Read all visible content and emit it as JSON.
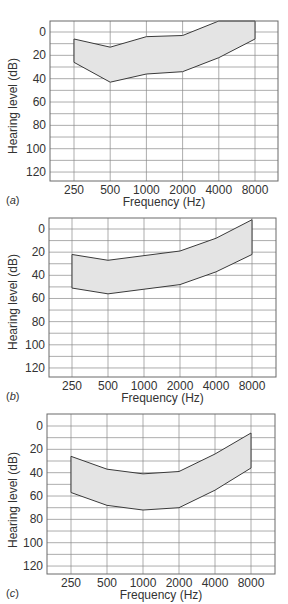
{
  "figure": {
    "panels": [
      {
        "letter_open": "(",
        "letter": "a",
        "letter_close": ")"
      },
      {
        "letter_open": "(",
        "letter": "b",
        "letter_close": ")"
      },
      {
        "letter_open": "(",
        "letter": "c",
        "letter_close": ")"
      }
    ],
    "colors": {
      "band_fill": "#e4e4e4",
      "band_stroke": "#3a3a3a",
      "grid": "#8a8a8a",
      "frame": "#6a6a6a",
      "text": "#333333"
    }
  },
  "chart_data": [
    {
      "type": "area",
      "subtype": "audiogram-range-band",
      "panel_label": "(a)",
      "title": "",
      "xlabel": "Frequency (Hz)",
      "ylabel": "Hearing level (dB)",
      "categories": [
        "250",
        "500",
        "1000",
        "2000",
        "4000",
        "8000"
      ],
      "y_ticks": [
        "0",
        "20",
        "40",
        "60",
        "80",
        "100",
        "120"
      ],
      "ylim": [
        -10,
        128
      ],
      "y_inverted": true,
      "grid": true,
      "legend": null,
      "series": [
        {
          "name": "upper bound",
          "values": [
            6,
            13,
            4,
            3,
            -10,
            -10
          ]
        },
        {
          "name": "lower bound",
          "values": [
            26,
            43,
            36,
            34,
            22,
            6
          ]
        }
      ]
    },
    {
      "type": "area",
      "subtype": "audiogram-range-band",
      "panel_label": "(b)",
      "title": "",
      "xlabel": "Frequency (Hz)",
      "ylabel": "Hearing level (dB)",
      "categories": [
        "250",
        "500",
        "1000",
        "2000",
        "4000",
        "8000"
      ],
      "y_ticks": [
        "0",
        "20",
        "40",
        "60",
        "80",
        "100",
        "120"
      ],
      "ylim": [
        -10,
        128
      ],
      "y_inverted": true,
      "grid": true,
      "legend": null,
      "series": [
        {
          "name": "upper bound",
          "values": [
            22,
            27,
            23,
            19,
            8,
            -8
          ]
        },
        {
          "name": "lower bound",
          "values": [
            51,
            56,
            52,
            48,
            37,
            22
          ]
        }
      ]
    },
    {
      "type": "area",
      "subtype": "audiogram-range-band",
      "panel_label": "(c)",
      "title": "",
      "xlabel": "Frequency (Hz)",
      "ylabel": "Hearing level (dB)",
      "categories": [
        "250",
        "500",
        "1000",
        "2000",
        "4000",
        "8000"
      ],
      "y_ticks": [
        "0",
        "20",
        "40",
        "60",
        "80",
        "100",
        "120"
      ],
      "ylim": [
        -10,
        128
      ],
      "y_inverted": true,
      "grid": true,
      "legend": null,
      "series": [
        {
          "name": "upper bound",
          "values": [
            26,
            37,
            41,
            39,
            24,
            6
          ]
        },
        {
          "name": "lower bound",
          "values": [
            57,
            68,
            72,
            70,
            55,
            36
          ]
        }
      ]
    }
  ]
}
